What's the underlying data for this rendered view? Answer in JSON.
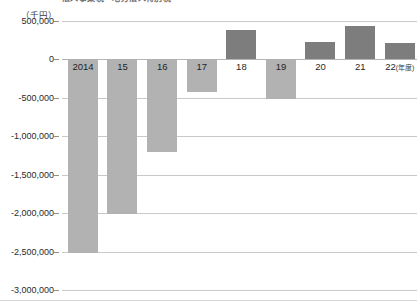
{
  "title": "法人事業税・地方法人特別税",
  "unit_label": "（千円）",
  "x_axis_suffix": "(年度)",
  "colors": {
    "positive_bar": "#7d7d7d",
    "negative_bar": "#b2b2b2",
    "gridline": "#c9c9c9",
    "zero_line": "#b4b4b4",
    "text": "#1f1f1f"
  },
  "chart_data": {
    "type": "bar",
    "title": "法人事業税・地方法人特別税",
    "xlabel": "(年度)",
    "ylabel": "（千円）",
    "ylim": [
      -3000000,
      500000
    ],
    "ytick_labels": [
      "500,000",
      "0",
      "-500,000",
      "-1,000,000",
      "-1,500,000",
      "-2,000,000",
      "-2,500,000",
      "-3,000,000"
    ],
    "ytick_values": [
      500000,
      0,
      -500000,
      -1000000,
      -1500000,
      -2000000,
      -2500000,
      -3000000
    ],
    "grid": true,
    "legend": "none",
    "categories": [
      "2014",
      "15",
      "16",
      "17",
      "18",
      "19",
      "20",
      "21",
      "22"
    ],
    "values": [
      -2520000,
      -2010000,
      -1200000,
      -430000,
      380000,
      -520000,
      230000,
      430000,
      220000
    ]
  }
}
